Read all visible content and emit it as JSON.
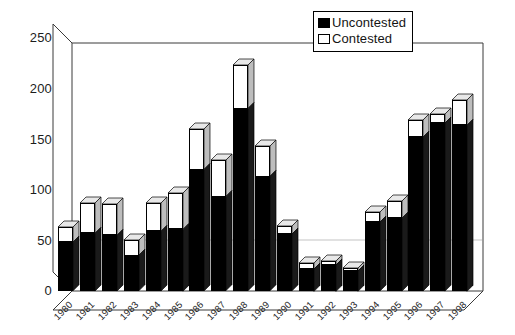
{
  "chart_data": {
    "type": "bar",
    "subtype": "stacked-3d-column",
    "title": "",
    "xlabel": "",
    "ylabel": "",
    "ylim": [
      0,
      262
    ],
    "yticks": [
      0,
      50,
      100,
      150,
      200,
      250
    ],
    "ytick_labels": [
      "0",
      "50",
      "100",
      "150",
      "200",
      "250"
    ],
    "grid": false,
    "legend_position": "top-right",
    "categories": [
      "1980",
      "1981",
      "1982",
      "1983",
      "1984",
      "1985",
      "1986",
      "1987",
      "1988",
      "1989",
      "1990",
      "1991",
      "1992",
      "1993",
      "1994",
      "1995",
      "1996",
      "1997",
      "1998"
    ],
    "series": [
      {
        "name": "Uncontested",
        "color": "#000000",
        "values": [
          48,
          57,
          55,
          35,
          59,
          61,
          120,
          93,
          180,
          113,
          56,
          22,
          26,
          20,
          68,
          72,
          152,
          166,
          164
        ]
      },
      {
        "name": "Contested",
        "color": "#ffffff",
        "values": [
          15,
          30,
          31,
          15,
          28,
          36,
          40,
          36,
          43,
          30,
          8,
          6,
          4,
          3,
          10,
          17,
          17,
          9,
          25
        ]
      }
    ],
    "totals": [
      63,
      87,
      86,
      50,
      87,
      97,
      160,
      129,
      223,
      143,
      64,
      28,
      30,
      23,
      78,
      89,
      169,
      175,
      189
    ]
  },
  "legend": {
    "items": [
      {
        "label": "Uncontested",
        "swatch": "black"
      },
      {
        "label": "Contested",
        "swatch": "white"
      }
    ]
  },
  "axes": {
    "y_tick_labels": [
      "250",
      "200",
      "150",
      "100",
      "50",
      "0"
    ],
    "x_tick_labels": [
      "1980",
      "1981",
      "1982",
      "1983",
      "1984",
      "1985",
      "1986",
      "1987",
      "1988",
      "1989",
      "1990",
      "1991",
      "1992",
      "1993",
      "1994",
      "1995",
      "1996",
      "1997",
      "1998"
    ]
  }
}
